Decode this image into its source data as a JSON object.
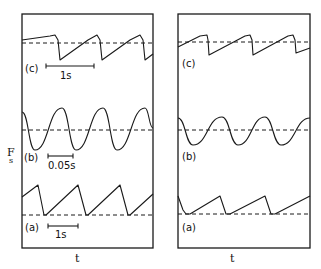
{
  "chart_data": [
    {
      "type": "line",
      "panel": "left",
      "title": "",
      "xlabel": "t",
      "ylabel": "Fs",
      "grid": false,
      "legend": "none",
      "series": [
        {
          "name": "(c)",
          "shape": "sawtooth (slow rise, fast drop)",
          "scale_bar": "1s",
          "reference": "dashed baseline",
          "points": [
            [
              22,
              40
            ],
            [
              50,
              36
            ],
            [
              55,
              35
            ],
            [
              58,
              40
            ],
            [
              60,
              60
            ],
            [
              88,
              40
            ],
            [
              97,
              35
            ],
            [
              100,
              40
            ],
            [
              102,
              60
            ],
            [
              130,
              40
            ],
            [
              140,
              35
            ],
            [
              143,
              40
            ],
            [
              145,
              60
            ],
            [
              153,
              54
            ]
          ]
        },
        {
          "name": "(b)",
          "shape": "sinusoidal",
          "scale_bar": "0.05s",
          "reference": "dashed baseline",
          "points": [
            [
              22,
              112
            ],
            [
              35,
              150
            ],
            [
              62,
              108
            ],
            [
              76,
              150
            ],
            [
              103,
              108
            ],
            [
              117,
              150
            ],
            [
              145,
              108
            ],
            [
              153,
              128
            ]
          ]
        },
        {
          "name": "(a)",
          "shape": "sawtooth (slow rise, fast drop to baseline)",
          "scale_bar": "1s",
          "reference": "dashed baseline",
          "points": [
            [
              22,
              197
            ],
            [
              38,
              185
            ],
            [
              44,
              215
            ],
            [
              46,
              215
            ],
            [
              78,
              185
            ],
            [
              86,
              215
            ],
            [
              88,
              215
            ],
            [
              120,
              185
            ],
            [
              128,
              215
            ],
            [
              130,
              215
            ],
            [
              153,
              194
            ]
          ]
        }
      ]
    },
    {
      "type": "line",
      "panel": "right",
      "title": "",
      "xlabel": "t",
      "ylabel": "",
      "grid": false,
      "legend": "none",
      "series": [
        {
          "name": "(c)",
          "shape": "sawtooth (slow rise, fast drop)",
          "points": [
            [
              178,
              47
            ],
            [
              200,
              36
            ],
            [
              207,
              35
            ],
            [
              208,
              40
            ],
            [
              209,
              55
            ],
            [
              245,
              36
            ],
            [
              250,
              35
            ],
            [
              252,
              40
            ],
            [
              253,
              55
            ],
            [
              288,
              36
            ],
            [
              293,
              35
            ],
            [
              295,
              40
            ],
            [
              296,
              53
            ],
            [
              310,
              48
            ]
          ]
        },
        {
          "name": "(b)",
          "shape": "sinusoidal (smaller amplitude)",
          "points": [
            [
              178,
              118
            ],
            [
              193,
              145
            ],
            [
              222,
              117
            ],
            [
              238,
              145
            ],
            [
              265,
              117
            ],
            [
              281,
              145
            ],
            [
              310,
              118
            ]
          ]
        },
        {
          "name": "(a)",
          "shape": "sawtooth (sharp drop, slow rise)",
          "points": [
            [
              178,
              196
            ],
            [
              183,
              210
            ],
            [
              186,
              214
            ],
            [
              190,
              214
            ],
            [
              220,
              196
            ],
            [
              226,
              214
            ],
            [
              230,
              214
            ],
            [
              265,
              196
            ],
            [
              271,
              214
            ],
            [
              275,
              214
            ],
            [
              310,
              196
            ]
          ]
        }
      ]
    }
  ],
  "figure": {
    "left": {
      "ylabel_main": "F",
      "ylabel_sub": "s",
      "xlabel": "t",
      "labels": {
        "c": "(c)",
        "b": "(b)",
        "a": "(a)"
      },
      "scale_bars": {
        "c": "1s",
        "b": "0.05s",
        "a": "1s"
      }
    },
    "right": {
      "xlabel": "t",
      "labels": {
        "c": "(c)",
        "b": "(b)",
        "a": "(a)"
      }
    }
  }
}
